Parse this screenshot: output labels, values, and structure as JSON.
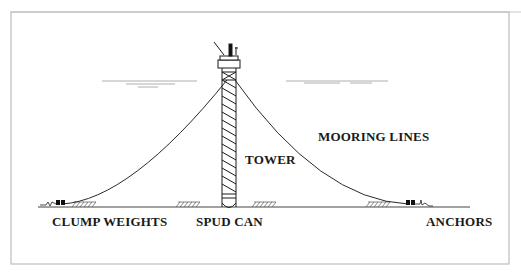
{
  "diagram": {
    "labels": {
      "tower": "TOWER",
      "mooring_lines": "MOORING LINES",
      "clump_weights": "CLUMP WEIGHTS",
      "spud_can": "SPUD CAN",
      "anchors": "ANCHORS"
    },
    "colors": {
      "line": "#2a2a2a",
      "frame": "#bdbdbd",
      "water": "#9a9a9a",
      "text": "#1a1a1a",
      "background": "#ffffff"
    }
  }
}
